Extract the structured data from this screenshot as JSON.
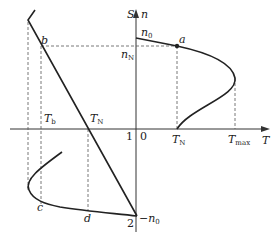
{
  "diagram": {
    "axes": {
      "vertical_labels": [
        "S",
        "n"
      ],
      "horizontal_label": "T",
      "origin_label": "0",
      "origin_left_label": "1"
    },
    "points": {
      "a": "a",
      "b": "b",
      "c": "c",
      "d": "d",
      "two": "2"
    },
    "speed_labels": {
      "n0": {
        "base": "n",
        "sub": "0"
      },
      "nN": {
        "base": "n",
        "sub": "N"
      },
      "neg_n0": {
        "base": "−n",
        "sub": "0"
      }
    },
    "torque_labels": {
      "Tb": {
        "base": "T",
        "sub": "b"
      },
      "TN_left": {
        "base": "T",
        "sub": "N"
      },
      "TN_right": {
        "base": "T",
        "sub": "N"
      },
      "Tmax": {
        "base": "T",
        "sub": "max"
      }
    },
    "colors": {
      "line": "#222222",
      "dashed": "#555555",
      "background": "#ffffff"
    }
  }
}
